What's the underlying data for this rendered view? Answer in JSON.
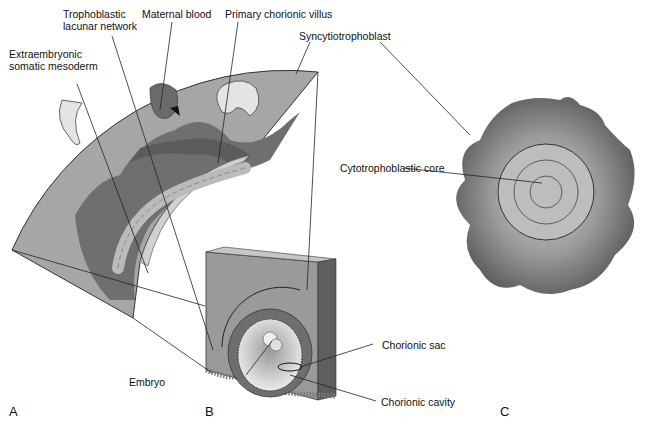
{
  "figure": {
    "panels": [
      {
        "id": "A",
        "label": "A"
      },
      {
        "id": "B",
        "label": "B"
      },
      {
        "id": "C",
        "label": "C"
      }
    ],
    "labels": {
      "trophoblastic_lacunar_network_1": "Trophoblastic",
      "trophoblastic_lacunar_network_2": "lacunar network",
      "maternal_blood": "Maternal blood",
      "primary_chorionic_villus": "Primary chorionic villus",
      "extraembryonic_somatic_mesoderm_1": "Extraembryonic",
      "extraembryonic_somatic_mesoderm_2": "somatic mesoderm",
      "syncytiotrophoblast": "Syncytiotrophoblast",
      "cytotrophoblastic_core": "Cytotrophoblastic core",
      "chorionic_sac": "Chorionic sac",
      "embryo": "Embryo",
      "chorionic_cavity": "Chorionic cavity"
    },
    "colors": {
      "sector_light": "#a8a8a8",
      "sector_dark": "#6e6e6e",
      "syncytium": "#7a7a7a",
      "cell_fill": "#d8d8d8",
      "cavity": "#e6e6e6",
      "block_front": "#9a9a9a",
      "block_side": "#5e5e5e",
      "block_top": "#c4c4c4"
    }
  }
}
